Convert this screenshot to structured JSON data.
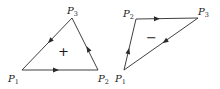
{
  "diagrams": [
    {
      "name": "left-triangle",
      "orientation": "counterclockwise",
      "sign": "+",
      "vertices": [
        {
          "label": "P",
          "sub": "1",
          "x": 22,
          "y": 70
        },
        {
          "label": "P",
          "sub": "2",
          "x": 98,
          "y": 70
        },
        {
          "label": "P",
          "sub": "3",
          "x": 72,
          "y": 18
        }
      ],
      "edge_order": [
        "P1→P2",
        "P2→P3",
        "P3→P1"
      ]
    },
    {
      "name": "right-triangle",
      "orientation": "clockwise",
      "sign": "−",
      "vertices": [
        {
          "label": "P",
          "sub": "1",
          "x": 124,
          "y": 70
        },
        {
          "label": "P",
          "sub": "2",
          "x": 136,
          "y": 19
        },
        {
          "label": "P",
          "sub": "3",
          "x": 198,
          "y": 18
        }
      ],
      "edge_order": [
        "P1→P2",
        "P2→P3",
        "P3→P1"
      ]
    }
  ],
  "colors": {
    "line": "#2a2a2a",
    "text": "#1a1a1a",
    "background": "#ffffff"
  }
}
